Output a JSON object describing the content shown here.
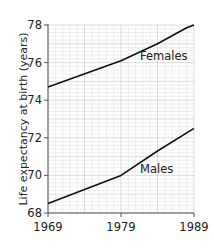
{
  "chart_data": {
    "type": "line",
    "title": "",
    "xlabel": "",
    "ylabel": "Life expectancy at birth (years)",
    "x": [
      1969,
      1979,
      1989
    ],
    "xticks": [
      "1969",
      "1979",
      "1989"
    ],
    "yticks": [
      "68",
      "70",
      "72",
      "74",
      "76",
      "78"
    ],
    "xlim": [
      1969,
      1989
    ],
    "ylim": [
      68,
      78
    ],
    "grid": true,
    "legend": "inline labels",
    "series": [
      {
        "name": "Females",
        "values": [
          74.7,
          76.1,
          78.0
        ],
        "midpoints": [
          [
            1969,
            74.7
          ],
          [
            1979,
            76.1
          ],
          [
            1984,
            77.0
          ],
          [
            1988,
            77.85
          ],
          [
            1989,
            78.0
          ]
        ]
      },
      {
        "name": "Males",
        "values": [
          68.5,
          70.0,
          72.5
        ],
        "midpoints": [
          [
            1969,
            68.5
          ],
          [
            1979,
            70.0
          ],
          [
            1984,
            71.3
          ],
          [
            1989,
            72.5
          ]
        ]
      }
    ],
    "colors": {
      "line": "#111111",
      "grid": "#c8c8c8",
      "axis": "#555555"
    }
  }
}
